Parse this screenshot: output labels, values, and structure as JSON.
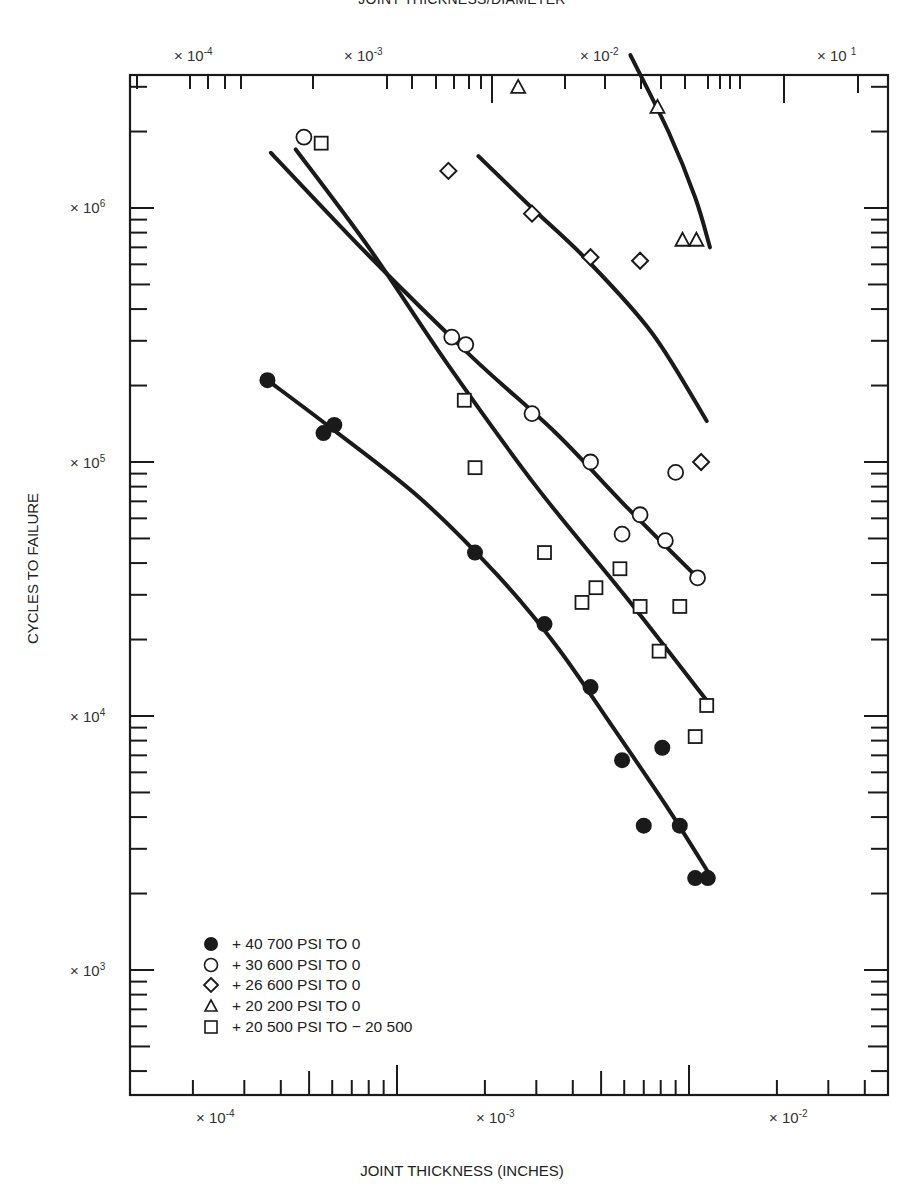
{
  "chart_data": {
    "type": "scatter",
    "title": "JOINT THICKNESS/DIAMETER",
    "xlabel": "JOINT THICKNESS (INCHES)",
    "ylabel": "CYCLES TO FAILURE",
    "xscale": "log",
    "yscale": "log",
    "xlim": [
      8e-05,
      0.02
    ],
    "ylim": [
      400,
      4000000
    ],
    "grid": false,
    "legend_position": "lower left",
    "top_axis_labels": [
      "× 10^-4",
      "× 10^-3",
      "× 10^-2",
      "× 10 1"
    ],
    "bottom_axis_labels": [
      "× 10^-4",
      "× 10^-3",
      "× 10^-2"
    ],
    "left_axis_labels": [
      "× 10^6",
      "× 10^5",
      "× 10^4",
      "× 10^3"
    ],
    "series": [
      {
        "name": "+ 40 700 PSI TO 0",
        "marker": "filled-circle",
        "x": [
          0.00036,
          0.00056,
          0.00061,
          0.00185,
          0.0032,
          0.0046,
          0.0059,
          0.0081,
          0.007,
          0.0093,
          0.0105,
          0.0116
        ],
        "y": [
          210000,
          130000,
          140000,
          44000,
          23000,
          13000,
          6700,
          7500,
          3700,
          3700,
          2300,
          2300
        ]
      },
      {
        "name": "+ 30 600 PSI TO 0",
        "marker": "open-circle",
        "x": [
          0.00048,
          0.00154,
          0.00172,
          0.0029,
          0.0046,
          0.0068,
          0.0059,
          0.0083,
          0.009,
          0.0107
        ],
        "y": [
          1900000,
          310000,
          290000,
          155000,
          100000,
          62000,
          52000,
          49000,
          91000,
          35000
        ]
      },
      {
        "name": "+ 26 600 PSI TO 0",
        "marker": "open-diamond",
        "x": [
          0.0015,
          0.0029,
          0.0046,
          0.0068,
          0.011
        ],
        "y": [
          1400000,
          950000,
          640000,
          620000,
          100000
        ]
      },
      {
        "name": "+ 20 200 PSI TO 0",
        "marker": "open-triangle",
        "x": [
          0.0026,
          0.0078,
          0.0095,
          0.0106
        ],
        "y": [
          3000000,
          2500000,
          750000,
          750000
        ]
      },
      {
        "name": "+ 20 500 PSI TO -20 500",
        "marker": "open-square",
        "x": [
          0.00055,
          0.0017,
          0.00185,
          0.0032,
          0.0058,
          0.0043,
          0.0048,
          0.0068,
          0.0093,
          0.0079,
          0.0115,
          0.0105
        ],
        "y": [
          1800000,
          175000,
          95000,
          44000,
          38000,
          28000,
          32000,
          27000,
          27000,
          18000,
          11000,
          8300
        ]
      }
    ]
  },
  "labels": {
    "title": "JOINT THICKNESS/DIAMETER",
    "xlabel": "JOINT THICKNESS (INCHES)",
    "ylabel": "CYCLES TO FAILURE",
    "top": [
      {
        "base": "× 10",
        "exp": "-4"
      },
      {
        "base": "× 10",
        "exp": "-3"
      },
      {
        "base": "× 10",
        "exp": "-2"
      },
      {
        "base": "× 10 ",
        "exp": "1"
      }
    ],
    "bottom": [
      {
        "base": "× 10",
        "exp": "-4"
      },
      {
        "base": "× 10",
        "exp": "-3"
      },
      {
        "base": "× 10",
        "exp": "-2"
      }
    ],
    "left": [
      {
        "base": "× 10",
        "exp": "6"
      },
      {
        "base": "× 10",
        "exp": "5"
      },
      {
        "base": "× 10",
        "exp": "4"
      },
      {
        "base": "× 10",
        "exp": "3"
      }
    ]
  },
  "legend": [
    {
      "label": "+ 40 700 PSI TO 0",
      "marker": "filled-circle"
    },
    {
      "label": "+ 30 600 PSI TO 0",
      "marker": "open-circle"
    },
    {
      "label": "+ 26 600 PSI TO 0",
      "marker": "open-diamond"
    },
    {
      "label": "+ 20 200 PSI TO 0",
      "marker": "open-triangle"
    },
    {
      "label": "+ 20 500 PSI TO − 20 500",
      "marker": "open-square"
    }
  ],
  "colors": {
    "ink": "#1a1a1a",
    "background": "#ffffff"
  }
}
